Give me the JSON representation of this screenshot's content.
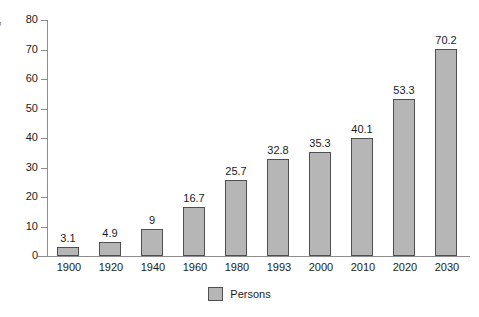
{
  "chart_data": {
    "type": "bar",
    "title": "",
    "subtitle": "",
    "xlabel": "",
    "ylabel": "",
    "categories": [
      "1900",
      "1920",
      "1940",
      "1960",
      "1980",
      "1993",
      "2000",
      "2010",
      "2020",
      "2030"
    ],
    "values": [
      3.1,
      4.9,
      9,
      16.7,
      25.7,
      32.8,
      35.3,
      40.1,
      53.3,
      70.2
    ],
    "value_labels": [
      "3.1",
      "4.9",
      "9",
      "16.7",
      "25.7",
      "32.8",
      "35.3",
      "40.1",
      "53.3",
      "70.2"
    ],
    "series": [
      {
        "name": "Persons",
        "values": [
          3.1,
          4.9,
          9,
          16.7,
          25.7,
          32.8,
          35.3,
          40.1,
          53.3,
          70.2
        ]
      }
    ],
    "ylim": [
      0,
      80
    ],
    "yticks": [
      0,
      10,
      20,
      30,
      40,
      50,
      60,
      70,
      80
    ],
    "ytick_labels": [
      "0",
      "10",
      "20",
      "30",
      "40",
      "50",
      "60",
      "70",
      "80"
    ],
    "grid": false,
    "legend_position": "bottom",
    "legend_entries": [
      "Persons"
    ],
    "bar_color": "#b6b6b6",
    "bar_border_color": "#4f4f4f",
    "axis_color": "#8d8d8d",
    "text_color": "#1a1a1a",
    "background_color": "#ffffff"
  },
  "axis": {
    "y_title_clipped": "s"
  },
  "legend": {
    "label": "Persons"
  }
}
